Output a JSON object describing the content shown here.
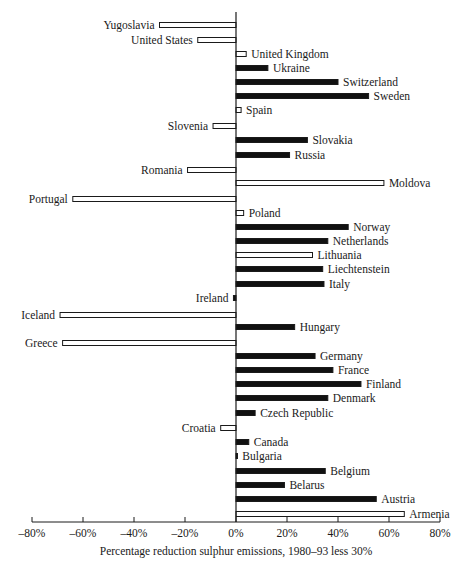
{
  "chart_data": {
    "type": "bar",
    "orientation": "horizontal",
    "title": "",
    "xlabel": "Percentage reduction sulphur emissions, 1980–93 less 30%",
    "ylabel": "",
    "xlim": [
      -80,
      80
    ],
    "x_ticks": [
      -80,
      -60,
      -40,
      -20,
      0,
      20,
      40,
      60,
      80
    ],
    "x_tick_labels": [
      "–80%",
      "–60%",
      "–40%",
      "–20%",
      "0%",
      "20%",
      "40%",
      "60%",
      "80%"
    ],
    "grid": false,
    "legend": null,
    "style_note": "filled black bars and hollow (outlined) bars",
    "categories": [
      "Yugoslavia",
      "United States",
      "United Kingdom",
      "Ukraine",
      "Switzerland",
      "Sweden",
      "Spain",
      "Slovenia",
      "Slovakia",
      "Russia",
      "Romania",
      "Moldova",
      "Portugal",
      "Poland",
      "Norway",
      "Netherlands",
      "Lithuania",
      "Liechtenstein",
      "Italy",
      "Ireland",
      "Iceland",
      "Hungary",
      "Greece",
      "Germany",
      "France",
      "Finland",
      "Denmark",
      "Czech Republic",
      "Croatia",
      "Canada",
      "Bulgaria",
      "Belgium",
      "Belarus",
      "Austria",
      "Armenia"
    ],
    "values": [
      -30,
      -15,
      4,
      12.5,
      40,
      52,
      2,
      -9,
      28,
      21,
      -19,
      58,
      -64,
      3,
      44,
      36,
      30,
      34,
      34.5,
      -1,
      -69,
      23,
      -68,
      31,
      38,
      49,
      36,
      7.5,
      -6,
      5,
      0.5,
      35,
      19,
      55,
      66
    ],
    "filled": [
      false,
      false,
      false,
      true,
      true,
      true,
      false,
      false,
      true,
      true,
      false,
      false,
      false,
      false,
      true,
      true,
      false,
      true,
      true,
      true,
      false,
      true,
      false,
      true,
      true,
      true,
      true,
      true,
      false,
      true,
      true,
      true,
      true,
      true,
      false
    ],
    "row_y": [
      25,
      40,
      54,
      68,
      82,
      96,
      110,
      126,
      140,
      155,
      170,
      183,
      199,
      213,
      227,
      241,
      255,
      269,
      284,
      298,
      315,
      327,
      343,
      356,
      370,
      384,
      398,
      413,
      428,
      442,
      456,
      471,
      485,
      499,
      514
    ]
  },
  "colors": {
    "filled_bar": "#111111",
    "hollow_bar_fill": "#ffffff",
    "outline": "#1a1a1a",
    "background": "#ffffff"
  }
}
